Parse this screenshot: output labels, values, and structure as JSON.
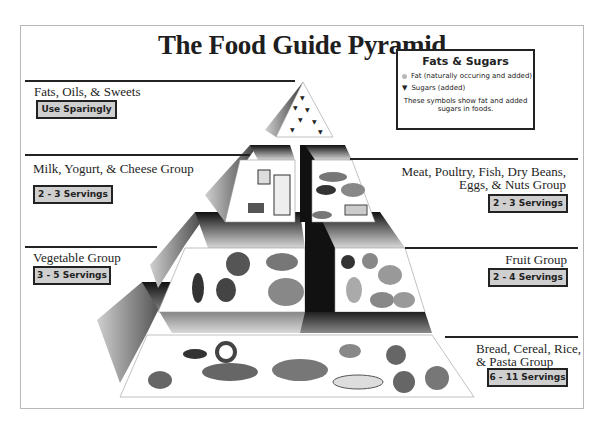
{
  "title": "The Food Guide Pyramid",
  "legend": {
    "title": "Fats & Sugars",
    "items": [
      {
        "symbol": "circle-icon",
        "label": "Fat (naturally occuring and added)"
      },
      {
        "symbol": "triangle-icon",
        "label": "Sugars (added)"
      }
    ],
    "note": "These symbols show fat and added sugars in foods."
  },
  "groups": {
    "fats": {
      "name": "Fats, Oils, & Sweets",
      "servings": "Use Sparingly"
    },
    "milk": {
      "name": "Milk, Yogurt, & Cheese Group",
      "servings": "2 - 3 Servings"
    },
    "meat": {
      "name_line1": "Meat, Poultry, Fish, Dry Beans,",
      "name_line2": "Eggs, & Nuts Group",
      "servings": "2 - 3 Servings"
    },
    "vegetable": {
      "name": "Vegetable Group",
      "servings": "3 - 5 Servings"
    },
    "fruit": {
      "name": "Fruit Group",
      "servings": "2 - 4 Servings"
    },
    "bread": {
      "name_line1": "Bread, Cereal, Rice,",
      "name_line2": "& Pasta Group",
      "servings": "6 - 11 Servings"
    }
  },
  "colors": {
    "badge_fill": "#cfcfcf",
    "ink": "#222222",
    "fat_dot": "#b8b8b8"
  }
}
